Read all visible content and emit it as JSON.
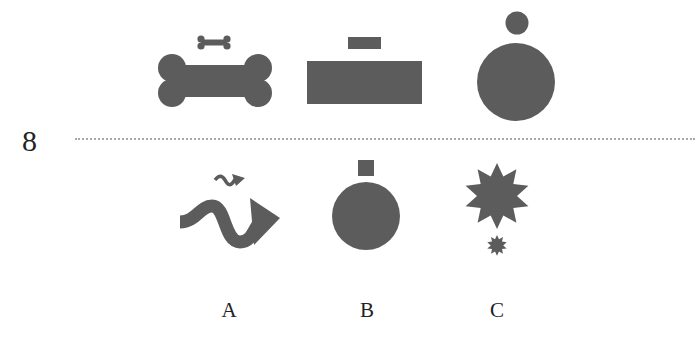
{
  "question": {
    "number": "8"
  },
  "colors": {
    "shape_fill": "#5c5c5c",
    "text": "#222222",
    "divider": "#a8a8a8",
    "background": "#ffffff"
  },
  "example_row": [
    {
      "name": "bone-pair",
      "small": "small bone",
      "large": "large bone"
    },
    {
      "name": "rectangle-pair",
      "small": "small rectangle",
      "large": "large rectangle"
    },
    {
      "name": "circle-pair",
      "small": "small circle",
      "large": "large circle"
    }
  ],
  "options": [
    {
      "label": "A",
      "description": "small wavy arrow above large wavy arrow"
    },
    {
      "label": "B",
      "description": "small square above large circle"
    },
    {
      "label": "C",
      "description": "large star above small star"
    }
  ]
}
